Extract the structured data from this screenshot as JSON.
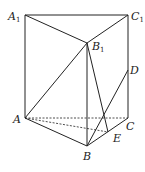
{
  "diagram": {
    "points": {
      "A1": {
        "x": 25,
        "y": 15
      },
      "C1": {
        "x": 128,
        "y": 15
      },
      "B1": {
        "x": 87,
        "y": 43
      },
      "A": {
        "x": 25,
        "y": 118
      },
      "C": {
        "x": 128,
        "y": 118
      },
      "B": {
        "x": 87,
        "y": 146
      },
      "D": {
        "x": 128,
        "y": 70
      },
      "E": {
        "x": 108,
        "y": 132
      }
    },
    "labels": {
      "A1": {
        "main": "A",
        "sub": "1"
      },
      "C1": {
        "main": "C",
        "sub": "1"
      },
      "B1": {
        "main": "B",
        "sub": "1"
      },
      "A": {
        "main": "A"
      },
      "B": {
        "main": "B"
      },
      "C": {
        "main": "C"
      },
      "D": {
        "main": "D"
      },
      "E": {
        "main": "E"
      }
    },
    "solid_edges": [
      "A1-C1",
      "A1-B1",
      "B1-C1",
      "A1-A",
      "C1-C",
      "B1-B",
      "A-B",
      "B-C",
      "A-B1",
      "B1-E",
      "B-D"
    ],
    "dashed_edges": [
      "A-C",
      "A-E"
    ],
    "stroke_color": "#222222"
  }
}
